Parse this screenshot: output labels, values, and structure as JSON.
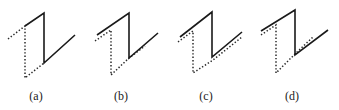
{
  "figure": {
    "panels": [
      {
        "label": "(a)",
        "label_pos": [
          36,
          100
        ],
        "solid": "25,26 44,13 44,63 75,35",
        "dotted": "8,39 25,26 25,78 44,63"
      },
      {
        "label": "(b)",
        "label_pos": [
          121,
          100
        ],
        "solid": "97,35 129,13 129,58 158,33",
        "dotted": "95,41 111,30 111,75 129,58 145,46"
      },
      {
        "label": "(c)",
        "label_pos": [
          206,
          100
        ],
        "solid": "180,37 212,12 212,57 242,32",
        "dotted": "178,42 193,31 193,73 213,60 242,37"
      },
      {
        "label": "(d)",
        "label_pos": [
          292,
          100
        ],
        "solid": "261,31 295,10 295,55 328,30",
        "dotted": "261,35 276,25 276,73 296,53 313,37"
      }
    ]
  }
}
